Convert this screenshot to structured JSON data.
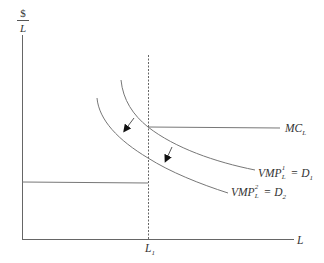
{
  "diagram": {
    "type": "labor-demand-shift",
    "colors": {
      "axis": "#666666",
      "curve": "#777777",
      "dashed": "#666666",
      "text": "#333333",
      "arrow": "#111111"
    },
    "y_axis": {
      "label_numerator": "$",
      "label_denominator": "L"
    },
    "x_axis": {
      "label": "L",
      "tick_label_main": "L",
      "tick_label_sub": "1"
    },
    "mc": {
      "main": "MC",
      "sub": "L"
    },
    "d1": {
      "main": "VMP",
      "sup": "1",
      "sub": "L",
      "eq": " = D",
      "dsub": "1"
    },
    "d2": {
      "main": "VMP",
      "sup": "2",
      "sub": "L",
      "eq": " = D",
      "dsub": "2"
    },
    "shift_arrows": 2
  }
}
